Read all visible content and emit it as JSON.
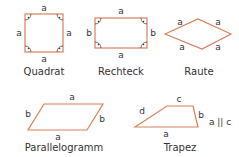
{
  "colors": {
    "outline": "#d9805a",
    "text": "#333333",
    "mark": "#333333"
  },
  "shapes": [
    {
      "id": "quadrat",
      "name": "Quadrat",
      "sides": {
        "top": "a",
        "bottom": "a",
        "left": "a",
        "right": "a"
      }
    },
    {
      "id": "rechteck",
      "name": "Rechteck",
      "sides": {
        "top": "a",
        "bottom": "a",
        "left": "b",
        "right": "b"
      }
    },
    {
      "id": "raute",
      "name": "Raute",
      "sides": {
        "top_left": "a",
        "top_right": "a",
        "bottom_left": "a",
        "bottom_right": "a"
      }
    },
    {
      "id": "parallelogramm",
      "name": "Parallelogramm",
      "sides": {
        "top": "a",
        "bottom": "a",
        "left": "b",
        "right": "b"
      }
    },
    {
      "id": "trapez",
      "name": "Trapez",
      "sides": {
        "top": "c",
        "bottom": "a",
        "left": "d",
        "right": "b"
      },
      "note": "a || c"
    }
  ]
}
